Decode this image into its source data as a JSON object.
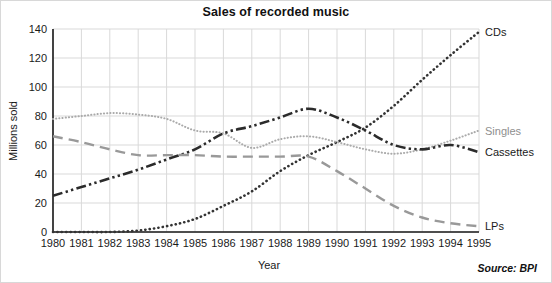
{
  "chart_data": {
    "type": "line",
    "title": "Sales of recorded music",
    "xlabel": "Year",
    "ylabel": "Millions sold",
    "source": "Source: BPI",
    "grid": true,
    "legend_position": "right-of-plot-inline",
    "x": [
      1980,
      1981,
      1982,
      1983,
      1984,
      1985,
      1986,
      1987,
      1988,
      1989,
      1990,
      1991,
      1992,
      1993,
      1994,
      1995
    ],
    "xlim": [
      1980,
      1995
    ],
    "ylim": [
      0,
      140
    ],
    "yticks": [
      0,
      20,
      40,
      60,
      80,
      100,
      120,
      140
    ],
    "xticks": [
      "1980",
      "1981",
      "1982",
      "1983",
      "1984",
      "1985",
      "1986",
      "1987",
      "1988",
      "1989",
      "1990",
      "1991",
      "1992",
      "1993",
      "1994",
      "1995"
    ],
    "series": [
      {
        "name": "CDs",
        "color": "#333333",
        "style": "dotted",
        "values": [
          0,
          0,
          0,
          1,
          4,
          9,
          18,
          28,
          42,
          53,
          62,
          72,
          87,
          105,
          122,
          138
        ]
      },
      {
        "name": "Singles",
        "color": "#aaaaaa",
        "style": "fine-dotted",
        "values": [
          78,
          80,
          82,
          81,
          78,
          70,
          68,
          58,
          64,
          66,
          62,
          57,
          54,
          57,
          63,
          70
        ]
      },
      {
        "name": "Cassettes",
        "color": "#2b2b2b",
        "style": "dash-dot-dot",
        "values": [
          25,
          31,
          37,
          43,
          50,
          57,
          68,
          73,
          79,
          85,
          79,
          70,
          60,
          57,
          60,
          55
        ]
      },
      {
        "name": "LPs",
        "color": "#999999",
        "style": "long-dash",
        "values": [
          66,
          62,
          57,
          53,
          53,
          53,
          52,
          52,
          52,
          52,
          42,
          30,
          18,
          10,
          6,
          4
        ]
      }
    ]
  }
}
